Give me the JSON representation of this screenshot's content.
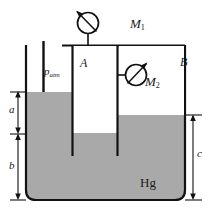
{
  "diagram": {
    "fluid_label": "Hg",
    "atmospheric_label": "p",
    "atmospheric_sub": "atm",
    "chamber_a_label": "A",
    "chamber_b_label": "B",
    "gauge1_label": "M",
    "gauge1_sub": "1",
    "gauge2_label": "M",
    "gauge2_sub": "2",
    "dim_a_label": "a",
    "dim_b_label": "b",
    "dim_c_label": "c",
    "colors": {
      "mercury": "#a9a9a9",
      "outline": "#111111",
      "gas": "#ffffff",
      "background": "#ffffff"
    },
    "levels": {
      "outer_left_surface_y": 92,
      "chamber_a_surface_y": 133,
      "chamber_b_surface_y": 115,
      "tank_bottom_y": 200,
      "tank_top_y": 45
    }
  }
}
